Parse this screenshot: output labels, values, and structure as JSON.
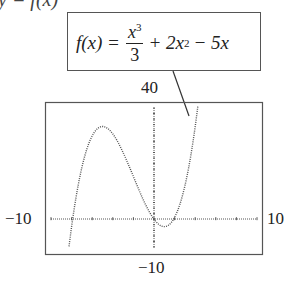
{
  "cut_title": "y = f(x)",
  "formula": {
    "lhs": "f(x) =",
    "frac_num": "x",
    "frac_num_exp": "3",
    "frac_den": "3",
    "term2": "+ 2x",
    "term2_exp": "2",
    "term3": "− 5x"
  },
  "labels": {
    "ymax": "40",
    "ymin": "−10",
    "xmin": "−10",
    "xmax": "10"
  },
  "chart_data": {
    "type": "line",
    "function": "x^3/3 + 2*x^2 - 5*x",
    "xlim": [
      -10,
      10
    ],
    "ylim": [
      -10,
      40
    ],
    "xscale_ticks": 2,
    "yscale_ticks": 2,
    "x_tick_labels": [
      "−10",
      "10"
    ],
    "y_tick_labels": [
      "−10",
      "40"
    ],
    "series": [
      {
        "name": "f(x)",
        "style": "dotted",
        "x": [
          -9.2,
          -9,
          -8,
          -7,
          -6,
          -5,
          -4,
          -3,
          -2,
          -1,
          0,
          1,
          2,
          3,
          4,
          4.5
        ],
        "y": [
          -5.5,
          0,
          13.3,
          20.7,
          30,
          33.3,
          30.7,
          24,
          14.3,
          6.3,
          0,
          -2.7,
          0.7,
          12,
          30.3,
          40.9
        ]
      }
    ],
    "key_points": {
      "local_max": [
        -5,
        33.3
      ],
      "local_min": [
        1,
        -2.67
      ],
      "x_intercepts": [
        -9,
        0,
        3
      ]
    },
    "grid": false,
    "legend": "callout box above plot with leader line to curve"
  }
}
